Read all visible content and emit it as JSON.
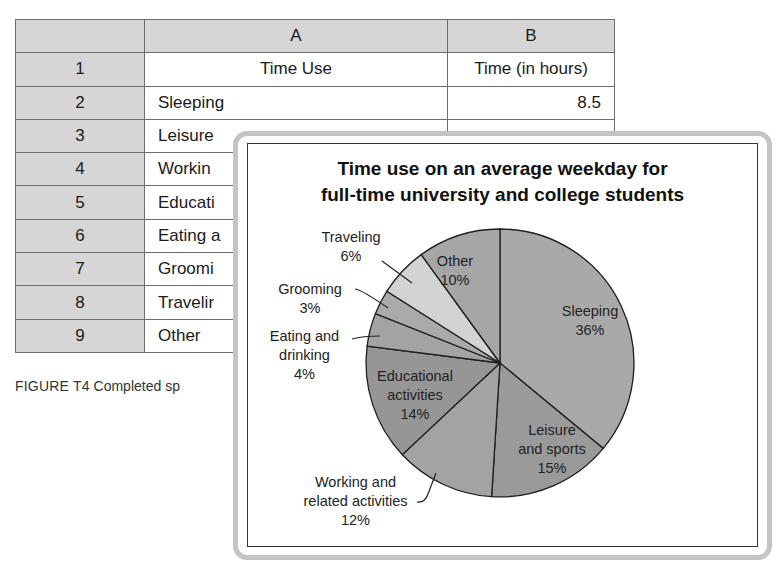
{
  "spreadsheet": {
    "column_headers": [
      "",
      "A",
      "B"
    ],
    "rows": [
      {
        "num": "1",
        "a": "Time Use",
        "b": "Time (in hours)"
      },
      {
        "num": "2",
        "a": "Sleeping",
        "b": "8.5"
      },
      {
        "num": "3",
        "a": "Leisure",
        "b": ""
      },
      {
        "num": "4",
        "a": "Workin",
        "b": ""
      },
      {
        "num": "5",
        "a": "Educati",
        "b": ""
      },
      {
        "num": "6",
        "a": "Eating a",
        "b": ""
      },
      {
        "num": "7",
        "a": "Groomi",
        "b": ""
      },
      {
        "num": "8",
        "a": "Travelir",
        "b": ""
      },
      {
        "num": "9",
        "a": "Other",
        "b": ""
      }
    ]
  },
  "caption": {
    "lead": "FIGURE T4",
    "text": "Completed sp"
  },
  "chart_data": {
    "type": "pie",
    "title_line1": "Time use on an average weekday for",
    "title_line2": "full-time university and college students",
    "start_angle_deg": 0,
    "direction": "clockwise",
    "slices": [
      {
        "label": "Sleeping",
        "value": 36,
        "pct": "36%",
        "color": "#a9a9a9"
      },
      {
        "label": "Leisure and sports",
        "value": 15,
        "pct": "15%",
        "color": "#9a9a9a"
      },
      {
        "label": "Working and related activities",
        "value": 12,
        "pct": "12%",
        "color": "#a3a3a3"
      },
      {
        "label": "Educational activities",
        "value": 14,
        "pct": "14%",
        "color": "#969696"
      },
      {
        "label": "Eating and drinking",
        "value": 4,
        "pct": "4%",
        "color": "#a3a3a3"
      },
      {
        "label": "Grooming",
        "value": 3,
        "pct": "3%",
        "color": "#aaaaaa"
      },
      {
        "label": "Traveling",
        "value": 6,
        "pct": "6%",
        "color": "#d3d3d3"
      },
      {
        "label": "Other",
        "value": 10,
        "pct": "10%",
        "color": "#a6a6a6"
      }
    ],
    "labels": {
      "sleeping": [
        "Sleeping",
        "36%"
      ],
      "leisure": [
        "Leisure",
        "and sports",
        "15%"
      ],
      "working": [
        "Working and",
        "related activities",
        "12%"
      ],
      "educational": [
        "Educational",
        "activities",
        "14%"
      ],
      "eating": [
        "Eating and",
        "drinking",
        "4%"
      ],
      "grooming": [
        "Grooming",
        "3%"
      ],
      "traveling": [
        "Traveling",
        "6%"
      ],
      "other": [
        "Other",
        "10%"
      ]
    }
  }
}
